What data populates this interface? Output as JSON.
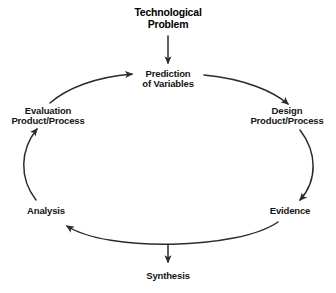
{
  "diagram": {
    "title": {
      "line1": "Technological",
      "line2": "Problem"
    },
    "stroke_color": "#2b2b2b",
    "text_color": "#141414",
    "background_color": "#ffffff",
    "nodes": [
      {
        "id": "prediction",
        "line1": "Prediction",
        "line2": "of Variables"
      },
      {
        "id": "design",
        "line1": "Design",
        "line2": "Product/Process"
      },
      {
        "id": "evidence",
        "line1": "Evidence",
        "line2": ""
      },
      {
        "id": "synthesis",
        "line1": "Synthesis",
        "line2": ""
      },
      {
        "id": "analysis",
        "line1": "Analysis",
        "line2": ""
      },
      {
        "id": "evaluation",
        "line1": "Evaluation",
        "line2": "Product/Process"
      }
    ],
    "connectors": [
      {
        "id": "problem-to-prediction",
        "from": "Technological Problem",
        "to": "Prediction of Variables",
        "style": "straight-down"
      },
      {
        "id": "prediction-to-design",
        "from": "Prediction of Variables",
        "to": "Design Product/Process",
        "style": "arc"
      },
      {
        "id": "design-to-evidence",
        "from": "Design Product/Process",
        "to": "Evidence",
        "style": "arc"
      },
      {
        "id": "evidence-to-analysis",
        "from": "Evidence",
        "to": "Analysis",
        "style": "arc"
      },
      {
        "id": "cycle-to-synthesis",
        "from": "Cycle",
        "to": "Synthesis",
        "style": "straight-down"
      },
      {
        "id": "analysis-to-evaluation",
        "from": "Analysis",
        "to": "Evaluation Product/Process",
        "style": "arc"
      },
      {
        "id": "evaluation-to-prediction",
        "from": "Evaluation Product/Process",
        "to": "Prediction of Variables",
        "style": "arc"
      }
    ]
  }
}
